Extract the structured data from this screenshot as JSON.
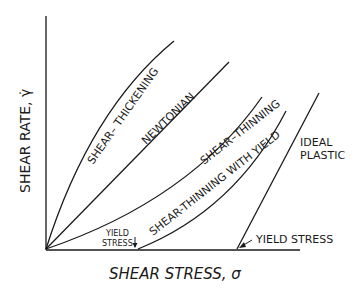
{
  "diagram": {
    "type": "rheology flow curves",
    "x_axis": {
      "label": "SHEAR STRESS, σ"
    },
    "y_axis": {
      "label": "SHEAR RATE, γ̇"
    },
    "curves": [
      {
        "id": "shear-thickening",
        "label": "SHEAR– THICKENING",
        "shape": "concave-down from origin"
      },
      {
        "id": "newtonian",
        "label": "NEWTONIAN",
        "shape": "straight line from origin"
      },
      {
        "id": "shear-thinning",
        "label": "SHEAR–THINNING",
        "shape": "concave-up from origin"
      },
      {
        "id": "shear-thinning-yield",
        "label": "SHEAR-THINNING WITH YIELD",
        "shape": "concave-up starting at yield stress"
      },
      {
        "id": "ideal-plastic",
        "label": "IDEAL PLASTIC",
        "label_line1": "IDEAL",
        "label_line2": "PLASTIC",
        "shape": "straight line starting at yield stress"
      }
    ],
    "annotations": {
      "yield_stress_small_line1": "YIELD",
      "yield_stress_small_line2": "STRESS",
      "yield_stress_right": "YIELD STRESS"
    },
    "colors": {
      "ink": "#1a1a1a",
      "background": "#ffffff"
    }
  }
}
